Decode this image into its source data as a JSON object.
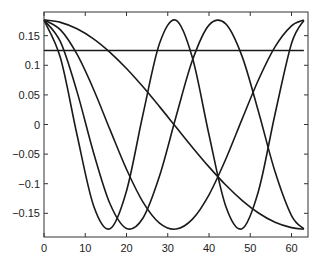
{
  "chart_data": {
    "type": "line",
    "title": "",
    "xlabel": "",
    "ylabel": "",
    "xlim": [
      0,
      64
    ],
    "ylim": [
      -0.19,
      0.19
    ],
    "grid": false,
    "legend": null,
    "xticks": [
      0,
      10,
      20,
      30,
      40,
      50,
      60
    ],
    "xtick_labels": [
      "0",
      "10",
      "20",
      "30",
      "40",
      "50",
      "60"
    ],
    "yticks": [
      0.15,
      0.1,
      0.05,
      0,
      -0.05,
      -0.1,
      -0.15
    ],
    "ytick_labels": [
      "0.15",
      "0.1",
      "0.05",
      "0",
      "−0.05",
      "−0.1",
      "−0.15"
    ],
    "x": [
      0,
      4,
      8,
      12,
      16,
      20,
      24,
      28,
      32,
      36,
      40,
      44,
      48,
      52,
      56,
      60,
      63
    ],
    "series": [
      {
        "name": "k=0",
        "color": "#1a1a1a",
        "values": [
          0.125,
          0.125,
          0.125,
          0.125,
          0.125,
          0.125,
          0.125,
          0.125,
          0.125,
          0.125,
          0.125,
          0.125,
          0.125,
          0.125,
          0.125,
          0.125,
          0.125
        ]
      },
      {
        "name": "k=1",
        "color": "#1a1a1a",
        "values": [
          0.1767,
          0.1725,
          0.1616,
          0.1446,
          0.1219,
          0.0946,
          0.0636,
          0.0302,
          -0.0043,
          -0.0387,
          -0.0716,
          -0.1018,
          -0.128,
          -0.1494,
          -0.165,
          -0.1742,
          -0.1767
        ]
      },
      {
        "name": "k=2",
        "color": "#1a1a1a",
        "values": [
          0.1766,
          0.1598,
          0.1187,
          0.0596,
          -0.0087,
          -0.0756,
          -0.131,
          -0.1665,
          -0.1766,
          -0.1598,
          -0.1187,
          -0.0596,
          0.0087,
          0.0756,
          0.131,
          0.1665,
          0.1766
        ]
      },
      {
        "name": "k=3",
        "color": "#1a1a1a",
        "values": [
          0.1763,
          0.1394,
          0.0555,
          -0.0472,
          -0.1339,
          -0.1755,
          -0.1579,
          -0.0871,
          0.013,
          0.1088,
          0.1679,
          0.1704,
          0.1155,
          0.0216,
          -0.0795,
          -0.1538,
          -0.1763
        ]
      },
      {
        "name": "k=4",
        "color": "#1a1a1a",
        "values": [
          0.176,
          0.1122,
          -0.0173,
          -0.1367,
          -0.176,
          -0.1122,
          0.0173,
          0.1367,
          0.176,
          0.1122,
          -0.0173,
          -0.1367,
          -0.176,
          -0.1122,
          0.0173,
          0.1367,
          0.176
        ]
      }
    ]
  },
  "style": {
    "axis_color": "#333333",
    "line_color": "#1a1a1a",
    "background": "#ffffff"
  }
}
